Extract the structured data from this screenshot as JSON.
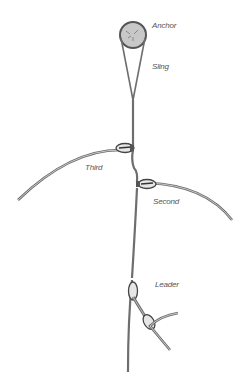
{
  "diagram": {
    "labels": {
      "anchor": "Anchor",
      "sling": "Sling",
      "third": "Third",
      "second": "Second",
      "leader": "Leader"
    },
    "colors": {
      "rope": "#6e6e6e",
      "rope_fill": "#bdbdbd",
      "anchor_fill": "#c8c8c8",
      "label": "#555555"
    }
  }
}
